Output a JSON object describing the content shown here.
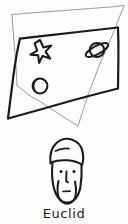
{
  "figure": {
    "caption": "Euclid",
    "background_color": "#fdfdfc",
    "ink_color": "#1b1b1b",
    "faint_ink_color": "#9a9a9a",
    "medium_ink_color": "#555555"
  },
  "planes": [
    {
      "name": "front-plane",
      "style": "thick-black",
      "stroke": "#1b1b1b",
      "stroke_width": 2.2,
      "points": "20,38 118,27 118,88 8,118"
    },
    {
      "name": "back-plane",
      "style": "thin-gray",
      "stroke": "#9a9a9a",
      "stroke_width": 1.0,
      "points": "12,14 124,5 78,126 17,85"
    }
  ],
  "symbols": [
    {
      "name": "star-symbol",
      "label": "star",
      "cx": 40,
      "cy": 50,
      "r": 10
    },
    {
      "name": "planet-symbol",
      "label": "saturn",
      "cx": 97,
      "cy": 50,
      "r": 9
    },
    {
      "name": "moon-symbol",
      "label": "crescent-moon",
      "cx": 40,
      "cy": 86,
      "r": 8
    }
  ],
  "portrait": {
    "name": "euclid-portrait",
    "label": "bearded figure wearing a cap",
    "head_center_x": 65,
    "head_top_y": 140,
    "head_bottom_y": 200,
    "features": {
      "hat": "beanie with brim",
      "left_eye": "dot",
      "right_eye": "dot",
      "nose": "vertical line",
      "beard": "outlined beard"
    }
  }
}
